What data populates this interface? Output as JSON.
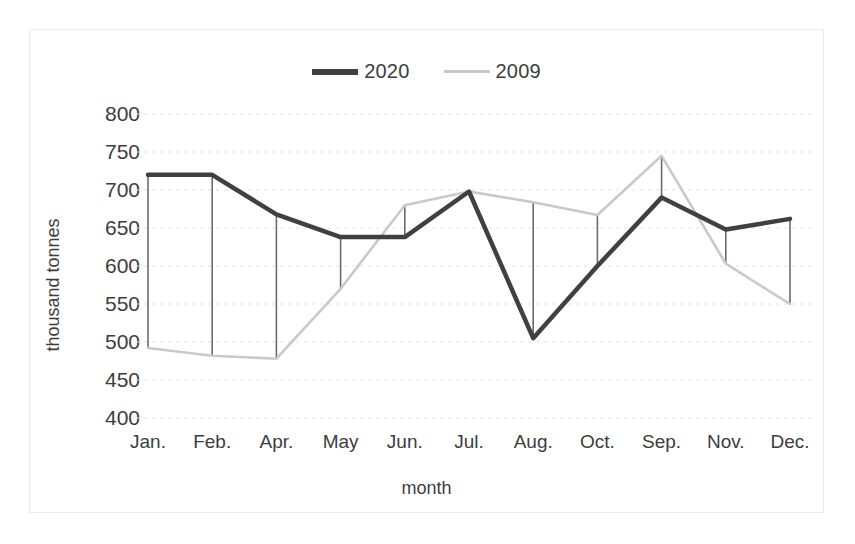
{
  "chart_data": {
    "type": "line",
    "title": "",
    "xlabel": "month",
    "ylabel": "thousand tonnes",
    "categories": [
      "Jan.",
      "Feb.",
      "Apr.",
      "May",
      "Jun.",
      "Jul.",
      "Aug.",
      "Oct.",
      "Sep.",
      "Nov.",
      "Dec."
    ],
    "series": [
      {
        "name": "2020",
        "color": "#404040",
        "values": [
          720,
          720,
          668,
          638,
          638,
          698,
          505,
          600,
          690,
          648,
          662
        ]
      },
      {
        "name": "2009",
        "color": "#c9c9c9",
        "values": [
          492,
          482,
          478,
          570,
          680,
          698,
          684,
          667,
          745,
          603,
          550
        ]
      }
    ],
    "ylim": [
      400,
      800
    ],
    "yticks": [
      800,
      750,
      700,
      650,
      600,
      550,
      500,
      450,
      400
    ],
    "grid": true,
    "grid_style": "dashed-horizontal",
    "grid_color": "#e2e2e2",
    "droplines": true,
    "dropline_color": "#6b6b6b",
    "legend_position": "top-center"
  },
  "legend": {
    "entries": [
      {
        "label": "2020",
        "swatch": "thick-dark-line"
      },
      {
        "label": "2009",
        "swatch": "thin-light-line"
      }
    ]
  },
  "axes": {
    "y_title": "thousand tonnes",
    "x_title": "month",
    "y_ticks": [
      "800",
      "750",
      "700",
      "650",
      "600",
      "550",
      "500",
      "450",
      "400"
    ],
    "x_ticks": [
      "Jan.",
      "Feb.",
      "Apr.",
      "May",
      "Jun.",
      "Jul.",
      "Aug.",
      "Oct.",
      "Sep.",
      "Nov.",
      "Dec."
    ]
  }
}
